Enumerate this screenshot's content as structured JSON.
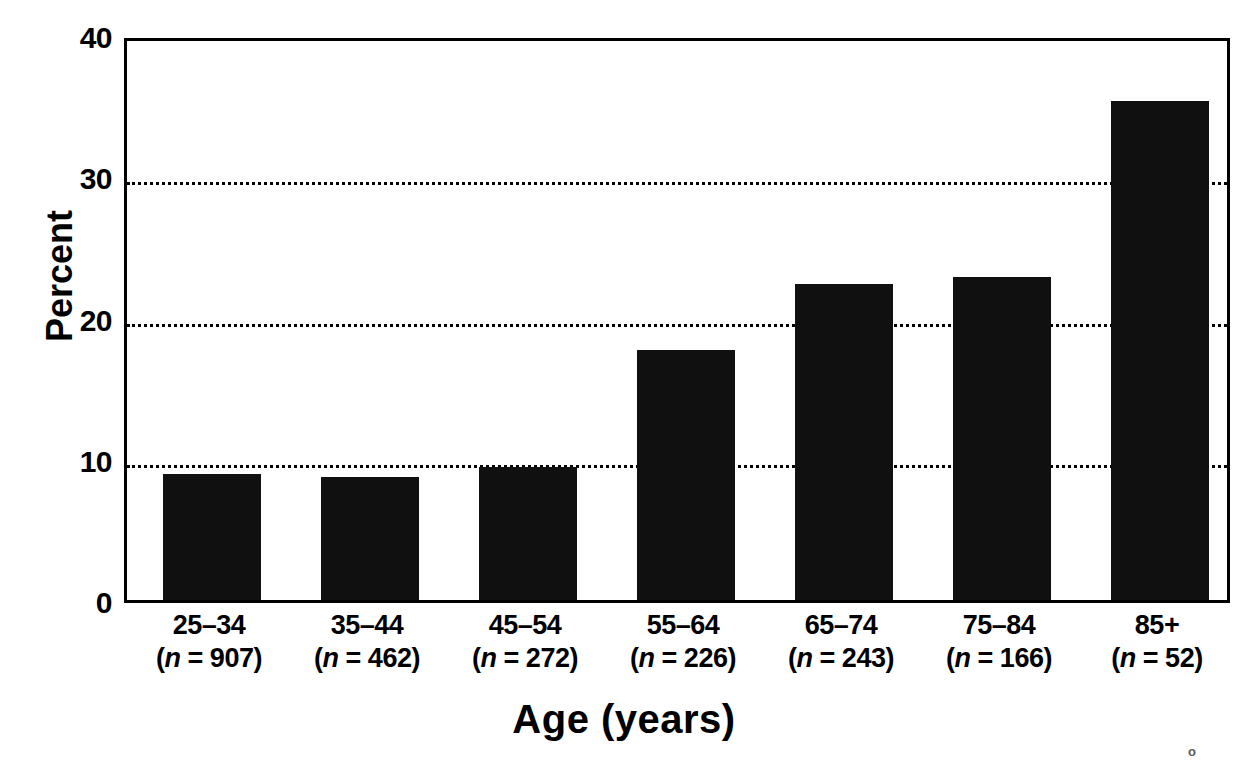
{
  "chart_data": {
    "type": "bar",
    "title": "",
    "xlabel": "Age (years)",
    "ylabel": "Percent",
    "categories": [
      "25–34",
      "35–44",
      "45–54",
      "55–64",
      "65–74",
      "75–84",
      "85+"
    ],
    "group_sizes": [
      907,
      462,
      272,
      226,
      243,
      166,
      52
    ],
    "category_sublabels": [
      "(n = 907)",
      "(n = 462)",
      "(n = 272)",
      "(n = 226)",
      "(n = 243)",
      "(n = 166)",
      "(n = 52)"
    ],
    "values": [
      8.9,
      8.7,
      9.4,
      17.7,
      22.4,
      22.9,
      35.3
    ],
    "ylim": [
      0,
      40
    ],
    "ytick_values": [
      0,
      10,
      20,
      30,
      40
    ],
    "ytick_labels": [
      "0",
      "10",
      "20",
      "30",
      "40"
    ],
    "gridlines_at": [
      10,
      20,
      30
    ],
    "grid": true,
    "grid_style": "dotted",
    "legend": "none",
    "bar_color": "#101010",
    "axis_color": "#000000",
    "background_color": "#ffffff"
  },
  "axes": {
    "y_title": "Percent",
    "x_title": "Age (years)"
  },
  "artifact": {
    "mark": "o"
  }
}
